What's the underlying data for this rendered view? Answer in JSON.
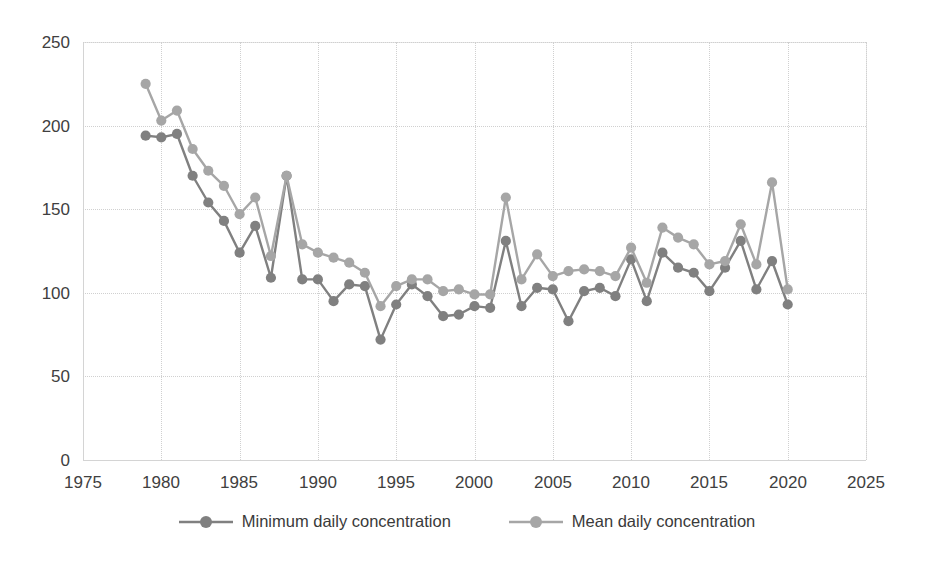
{
  "chart_data": {
    "type": "line",
    "title": "",
    "xlabel": "",
    "ylabel": "",
    "xlim": [
      1975,
      2025
    ],
    "ylim": [
      0,
      250
    ],
    "xticks": [
      "1975",
      "1980",
      "1985",
      "1990",
      "1995",
      "2000",
      "2005",
      "2010",
      "2015",
      "2020",
      "2025"
    ],
    "xtick_values": [
      1975,
      1980,
      1985,
      1990,
      1995,
      2000,
      2005,
      2010,
      2015,
      2020,
      2025
    ],
    "yticks": [
      "0",
      "50",
      "100",
      "150",
      "200",
      "250"
    ],
    "ytick_values": [
      0,
      50,
      100,
      150,
      200,
      250
    ],
    "grid": true,
    "grid_style": "dotted",
    "legend_position": "bottom",
    "x": [
      1979,
      1980,
      1981,
      1982,
      1983,
      1984,
      1985,
      1986,
      1987,
      1988,
      1989,
      1990,
      1991,
      1992,
      1993,
      1994,
      1995,
      1996,
      1997,
      1998,
      1999,
      2000,
      2001,
      2002,
      2003,
      2004,
      2005,
      2006,
      2007,
      2008,
      2009,
      2010,
      2011,
      2012,
      2013,
      2014,
      2015,
      2016,
      2017,
      2018,
      2019,
      2020
    ],
    "series": [
      {
        "name": "Minimum daily concentration",
        "color": "#808080",
        "values": [
          194,
          193,
          195,
          170,
          154,
          143,
          124,
          140,
          109,
          170,
          108,
          108,
          95,
          105,
          104,
          72,
          93,
          105,
          98,
          86,
          87,
          92,
          91,
          131,
          92,
          103,
          102,
          83,
          101,
          103,
          98,
          120,
          95,
          124,
          115,
          112,
          101,
          115,
          131,
          102,
          119,
          93
        ]
      },
      {
        "name": "Mean daily concentration",
        "color": "#a6a6a6",
        "values": [
          225,
          203,
          209,
          186,
          173,
          164,
          147,
          157,
          122,
          170,
          129,
          124,
          121,
          118,
          112,
          92,
          104,
          108,
          108,
          101,
          102,
          99,
          99,
          157,
          108,
          123,
          110,
          113,
          114,
          113,
          110,
          127,
          106,
          139,
          133,
          129,
          117,
          119,
          141,
          117,
          166,
          102
        ]
      }
    ],
    "legend": [
      {
        "label": "Minimum daily concentration",
        "color": "#808080"
      },
      {
        "label": "Mean daily concentration",
        "color": "#a6a6a6"
      }
    ]
  },
  "colors": {
    "min_series": "#808080",
    "mean_series": "#a6a6a6",
    "grid": "#d0d0d0",
    "axis": "#d4d4d4",
    "text": "#404040",
    "background": "#ffffff"
  }
}
